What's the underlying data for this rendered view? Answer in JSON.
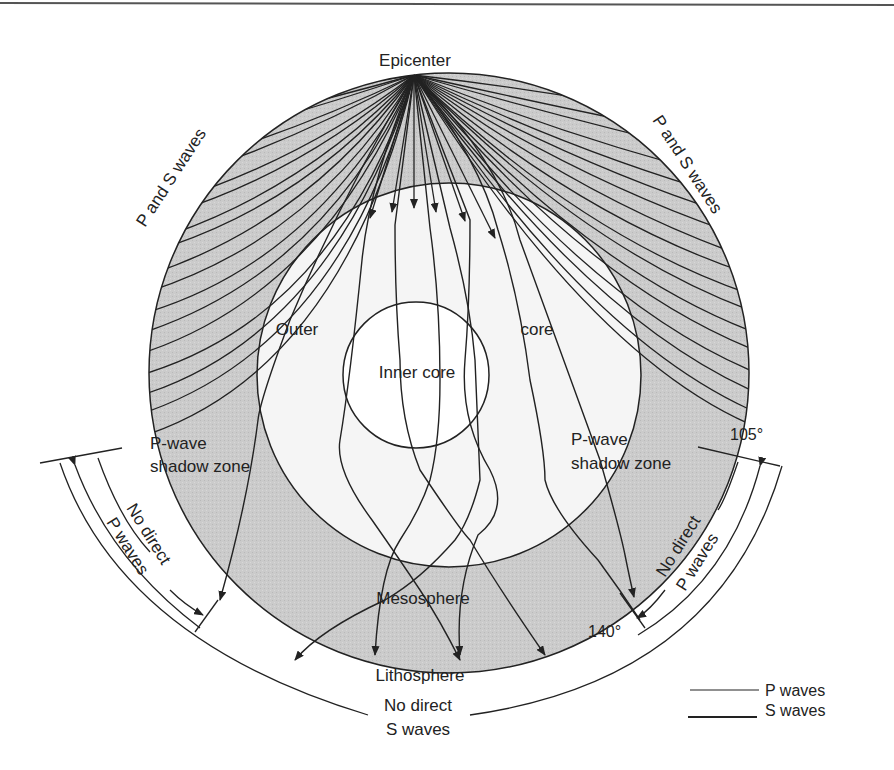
{
  "figure": {
    "top_rule": true,
    "colors": {
      "mantle_fill": "#c9c9c9",
      "core_fill": "#f4f4f4",
      "inner_core_fill": "#ffffff",
      "line": "#222222",
      "background": "#ffffff"
    }
  },
  "labels": {
    "epicenter": "Epicenter",
    "p_and_s_left": "P and S waves",
    "p_and_s_right": "P and S waves",
    "outer": "Outer",
    "core": "core",
    "inner_core": "Inner core",
    "shadow_left_line1": "P-wave",
    "shadow_left_line2": "shadow zone",
    "shadow_right_line1": "P-wave",
    "shadow_right_line2": "shadow zone",
    "no_direct_p_left_line1": "No direct",
    "no_direct_p_left_line2": "P waves",
    "no_direct_p_right_line1": "No direct",
    "no_direct_p_right_line2": "P waves",
    "angle_105": "105°",
    "angle_140": "140°",
    "mesosphere": "Mesosphere",
    "lithosphere": "Lithosphere",
    "no_direct_s_line1": "No direct",
    "no_direct_s_line2": "S waves"
  },
  "legend": {
    "items": [
      {
        "label": "P waves",
        "style": "thin"
      },
      {
        "label": "S waves",
        "style": "thick"
      }
    ]
  }
}
